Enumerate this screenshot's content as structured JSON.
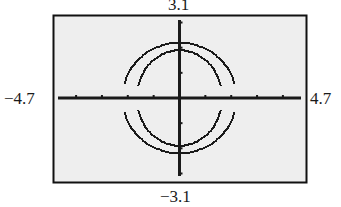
{
  "screen": {
    "background_color": "#eeeeee",
    "border_color": "#111111",
    "curve_color": "#1a1a1a"
  },
  "window": {
    "xmin_label": "−4.7",
    "xmax_label": "4.7",
    "ymin_label": "−3.1",
    "ymax_label": "3.1"
  },
  "chart_data": {
    "type": "line",
    "title": "",
    "xlabel": "",
    "ylabel": "",
    "xlim": [
      -4.7,
      4.7
    ],
    "ylim": [
      -3.1,
      3.1
    ],
    "grid": false,
    "x_ticks": [
      -4,
      -3,
      -2,
      -1,
      0,
      1,
      2,
      3,
      4
    ],
    "y_ticks": [
      -3,
      -2,
      -1,
      0,
      1,
      2,
      3
    ],
    "tick_labels": {
      "xmin": "−4.7",
      "xmax": "4.7",
      "ymin": "−3.1",
      "ymax": "3.1"
    },
    "series": [
      {
        "name": "outer curve",
        "shape": "circle",
        "center": [
          0,
          0
        ],
        "rx": 2.2,
        "ry": 2.2,
        "note": "drawn as upper and lower halves with gaps near the x-axis"
      },
      {
        "name": "inner curve",
        "shape": "ellipse",
        "center": [
          0,
          0
        ],
        "rx": 1.65,
        "ry": 1.9,
        "note": "drawn as upper and lower halves with gaps near the x-axis"
      }
    ]
  }
}
